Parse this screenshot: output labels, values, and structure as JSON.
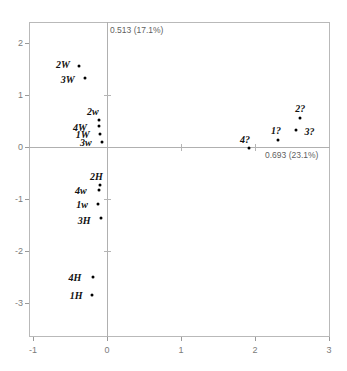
{
  "chart_data": {
    "type": "scatter",
    "title": "",
    "xlabel": "0.693 (23.1%)",
    "ylabel": "0.513 (17.1%)",
    "xlim": [
      -1,
      3
    ],
    "ylim": [
      -3,
      2
    ],
    "grid": false,
    "legend": "none",
    "xticks": [
      "-1",
      "0",
      "1",
      "2",
      "3"
    ],
    "xtick_values": [
      -1,
      0,
      1,
      2,
      3
    ],
    "yticks": [
      "2",
      "1",
      "0",
      "-1",
      "-2",
      "-3"
    ],
    "ytick_values": [
      2,
      1,
      0,
      -1,
      -2,
      -3
    ],
    "points": [
      {
        "label": "2W",
        "x": -0.38,
        "y": 1.55,
        "label_dx": -16,
        "label_dy": -2
      },
      {
        "label": "3W",
        "x": -0.3,
        "y": 1.33,
        "label_dx": -17,
        "label_dy": 1
      },
      {
        "label": "2w",
        "x": -0.11,
        "y": 0.52,
        "label_dx": -6,
        "label_dy": -9
      },
      {
        "label": "4W",
        "x": -0.11,
        "y": 0.4,
        "label_dx": -19,
        "label_dy": 1
      },
      {
        "label": "1W",
        "x": -0.1,
        "y": 0.25,
        "label_dx": -17,
        "label_dy": 0
      },
      {
        "label": "3w",
        "x": -0.07,
        "y": 0.1,
        "label_dx": -16,
        "label_dy": 0
      },
      {
        "label": "2H",
        "x": -0.09,
        "y": -0.73,
        "label_dx": -4,
        "label_dy": -9
      },
      {
        "label": "4w",
        "x": -0.11,
        "y": -0.83,
        "label_dx": -18,
        "label_dy": 0
      },
      {
        "label": "1w",
        "x": -0.12,
        "y": -1.1,
        "label_dx": -16,
        "label_dy": 0
      },
      {
        "label": "3H",
        "x": -0.08,
        "y": -1.36,
        "label_dx": -17,
        "label_dy": 2
      },
      {
        "label": "4H",
        "x": -0.19,
        "y": -2.5,
        "label_dx": -18,
        "label_dy": 0
      },
      {
        "label": "1H",
        "x": -0.2,
        "y": -2.85,
        "label_dx": -16,
        "label_dy": 0
      },
      {
        "label": "4?",
        "x": 1.92,
        "y": -0.02,
        "label_dx": -4,
        "label_dy": -9
      },
      {
        "label": "1?",
        "x": 2.31,
        "y": 0.13,
        "label_dx": -2,
        "label_dy": -10
      },
      {
        "label": "2?",
        "x": 2.61,
        "y": 0.55,
        "label_dx": 0,
        "label_dy": -10
      },
      {
        "label": "3?",
        "x": 2.56,
        "y": 0.33,
        "label_dx": 13,
        "label_dy": 1
      }
    ]
  }
}
